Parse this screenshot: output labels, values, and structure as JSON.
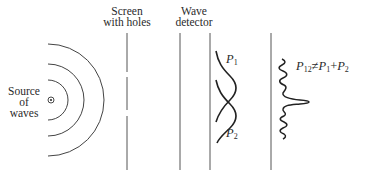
{
  "diagram": {
    "labels": {
      "source": [
        "Source",
        "of",
        "waves"
      ],
      "screen": [
        "Screen",
        "with holes"
      ],
      "detector": [
        "Wave",
        "detector"
      ]
    },
    "curves": {
      "p1": {
        "symbol": "P",
        "sub": "1"
      },
      "p2": {
        "symbol": "P",
        "sub": "2"
      },
      "p12": {
        "lhs_symbol": "P",
        "lhs_sub": "12",
        "neq": "≠",
        "a_symbol": "P",
        "a_sub": "1",
        "plus": "+",
        "b_symbol": "P",
        "b_sub": "2"
      }
    },
    "icons": {
      "source": "circled-dot-icon"
    },
    "colors": {
      "ink": "#2a2a2a",
      "line": "#555555",
      "background": "#ffffff"
    }
  }
}
